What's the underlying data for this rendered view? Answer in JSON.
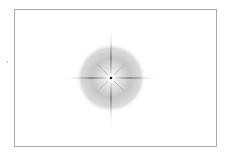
{
  "figure": {
    "type": "starburst-flare",
    "frame": {
      "x": 14,
      "y": 9,
      "width": 203,
      "height": 138,
      "border_color": "#a8a8a8"
    },
    "flare": {
      "center": {
        "x": 111,
        "y": 78
      },
      "glow_radius": 35,
      "glow_colors": {
        "inner": "#f4f4f4",
        "mid": "#c4c4c4",
        "outer": "#ffffff"
      },
      "ray_color": "#6e6e6e",
      "rays": {
        "horizontal_half_length": 48,
        "vertical_half_length": 50,
        "diagonal_half_length": 18
      },
      "core_color": "#1a1a1a"
    }
  }
}
